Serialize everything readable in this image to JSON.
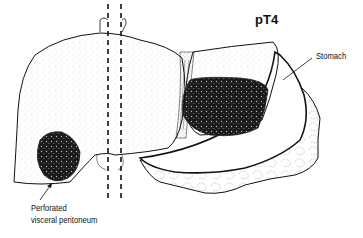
{
  "figure": {
    "title": "pT4",
    "labels": {
      "stomach": "Stomach",
      "perforated_line1": "Perforated",
      "perforated_line2": "visceral peritoneum"
    },
    "structures": [
      "liver",
      "gallbladder",
      "stomach",
      "omentum",
      "primary-tumor",
      "liver-tumor",
      "ligament",
      "vena-cava-dashed-lines"
    ],
    "colors": {
      "outline": "#111111",
      "stipple": "#555555",
      "tumor": "#1a1a1a",
      "background": "#ffffff"
    }
  }
}
